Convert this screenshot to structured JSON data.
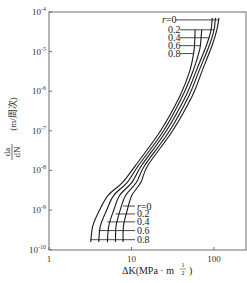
{
  "chart_data": {
    "type": "line",
    "title": "",
    "xlabel": "ΔK(MPa · m^1/2)",
    "xlabel_parts": {
      "main": "ΔK(MPa · m",
      "sup_num": "1",
      "sup_den": "2",
      "close": ")"
    },
    "ylabel": "da/dN (m/周次)",
    "ylabel_parts": {
      "num": "da",
      "den": "dN",
      "unit": "(m/周次)"
    },
    "xscale": "log",
    "yscale": "log",
    "xlim": [
      1,
      245
    ],
    "ylim": [
      1e-10,
      0.0001
    ],
    "x_ticks": [
      {
        "value": 1,
        "label": "1"
      },
      {
        "value": 10,
        "label": "10"
      },
      {
        "value": 100,
        "label": "100"
      }
    ],
    "y_ticks": [
      {
        "exp": -4,
        "label": "10",
        "sup": "-4"
      },
      {
        "exp": -5,
        "label": "10",
        "sup": "-5"
      },
      {
        "exp": -6,
        "label": "10",
        "sup": "-6"
      },
      {
        "exp": -7,
        "label": "10",
        "sup": "-7"
      },
      {
        "exp": -8,
        "label": "10",
        "sup": "-8"
      },
      {
        "exp": -9,
        "label": "10",
        "sup": "-9"
      },
      {
        "exp": -10,
        "label": "10",
        "sup": "-10"
      }
    ],
    "grid": false,
    "legend": "inline labels with leader lines (top-right and bottom-center)",
    "series": [
      {
        "name": "r=0",
        "label": "r=0",
        "points": [
          [
            7.9,
            -9.81
          ],
          [
            8.0,
            -9.4
          ],
          [
            8.9,
            -9.0
          ],
          [
            10.1,
            -8.63
          ],
          [
            13.0,
            -8.3
          ],
          [
            15.8,
            -7.87
          ],
          [
            31.5,
            -7.0
          ],
          [
            55,
            -6.1
          ],
          [
            72,
            -5.48
          ],
          [
            95,
            -4.84
          ],
          [
            108,
            -4.46
          ],
          [
            115,
            -4.15
          ]
        ]
      },
      {
        "name": "r=0.2",
        "label": "0.2",
        "points": [
          [
            6.4,
            -9.81
          ],
          [
            6.5,
            -9.4
          ],
          [
            7.3,
            -9.0
          ],
          [
            8.5,
            -8.63
          ],
          [
            11.5,
            -8.3
          ],
          [
            14.5,
            -7.87
          ],
          [
            29,
            -7.0
          ],
          [
            50,
            -6.1
          ],
          [
            66,
            -5.48
          ],
          [
            88,
            -4.84
          ],
          [
            100,
            -4.46
          ],
          [
            104,
            -4.15
          ]
        ]
      },
      {
        "name": "r=0.4",
        "label": "0.4",
        "points": [
          [
            5.1,
            -9.81
          ],
          [
            5.3,
            -9.4
          ],
          [
            6.1,
            -9.0
          ],
          [
            7.2,
            -8.63
          ],
          [
            10.1,
            -8.3
          ],
          [
            13.3,
            -7.87
          ],
          [
            26.5,
            -7.0
          ],
          [
            46,
            -6.1
          ],
          [
            61,
            -5.48
          ],
          [
            81,
            -4.84
          ],
          [
            92,
            -4.46
          ],
          [
            95,
            -4.15
          ]
        ]
      },
      {
        "name": "r=0.6",
        "label": "0.6",
        "points": [
          [
            4.0,
            -9.81
          ],
          [
            4.2,
            -9.4
          ],
          [
            5.0,
            -9.0
          ],
          [
            6.1,
            -8.63
          ],
          [
            8.9,
            -8.3
          ],
          [
            12.2,
            -7.87
          ],
          [
            24.5,
            -7.0
          ],
          [
            42,
            -6.1
          ],
          [
            56,
            -5.48
          ],
          [
            67,
            -4.95
          ],
          [
            70,
            -4.6
          ],
          [
            71,
            -4.45
          ]
        ]
      },
      {
        "name": "r=0.8",
        "label": "0.8",
        "points": [
          [
            3.2,
            -9.81
          ],
          [
            3.4,
            -9.4
          ],
          [
            4.1,
            -9.0
          ],
          [
            5.2,
            -8.63
          ],
          [
            7.8,
            -8.3
          ],
          [
            11.2,
            -7.87
          ],
          [
            22.5,
            -7.0
          ],
          [
            39,
            -6.1
          ],
          [
            51,
            -5.48
          ],
          [
            57,
            -5.0
          ],
          [
            58.5,
            -4.7
          ],
          [
            59,
            -4.45
          ]
        ]
      }
    ],
    "top_labels": [
      {
        "text": "r=0",
        "y_exp": -4.2
      },
      {
        "text": "0.2",
        "y_exp": -4.45
      },
      {
        "text": "0.4",
        "y_exp": -4.65
      },
      {
        "text": "0.6",
        "y_exp": -4.85
      },
      {
        "text": "0.8",
        "y_exp": -5.05
      }
    ],
    "bottom_labels": [
      {
        "text": "r=0",
        "y_exp": -8.9
      },
      {
        "text": "0.2",
        "y_exp": -9.1
      },
      {
        "text": "0.4",
        "y_exp": -9.3
      },
      {
        "text": "0.6",
        "y_exp": -9.52
      },
      {
        "text": "0.8",
        "y_exp": -9.75
      }
    ]
  }
}
